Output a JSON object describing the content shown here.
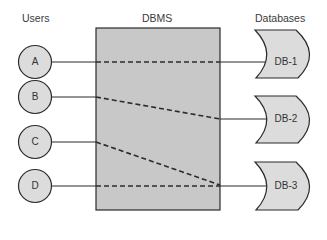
{
  "headers": {
    "users": "Users",
    "dbms": "DBMS",
    "databases": "Databases"
  },
  "users": [
    {
      "label": "A",
      "cy": 54
    },
    {
      "label": "B",
      "cy": 98
    },
    {
      "label": "C",
      "cy": 142
    },
    {
      "label": "D",
      "cy": 186
    }
  ],
  "databases": [
    {
      "label": "DB-1",
      "cy": 54
    },
    {
      "label": "DB-2",
      "cy": 119
    },
    {
      "label": "DB-3",
      "cy": 186
    }
  ],
  "connections": [
    {
      "from": "A",
      "to": "DB-1"
    },
    {
      "from": "B",
      "to": "DB-2"
    },
    {
      "from": "C",
      "to": "DB-3"
    },
    {
      "from": "D",
      "to": "DB-3"
    }
  ],
  "colors": {
    "box_fill": "#c8c8c8",
    "shape_fill": "#dcdcdc",
    "stroke": "#2b2b2b"
  }
}
